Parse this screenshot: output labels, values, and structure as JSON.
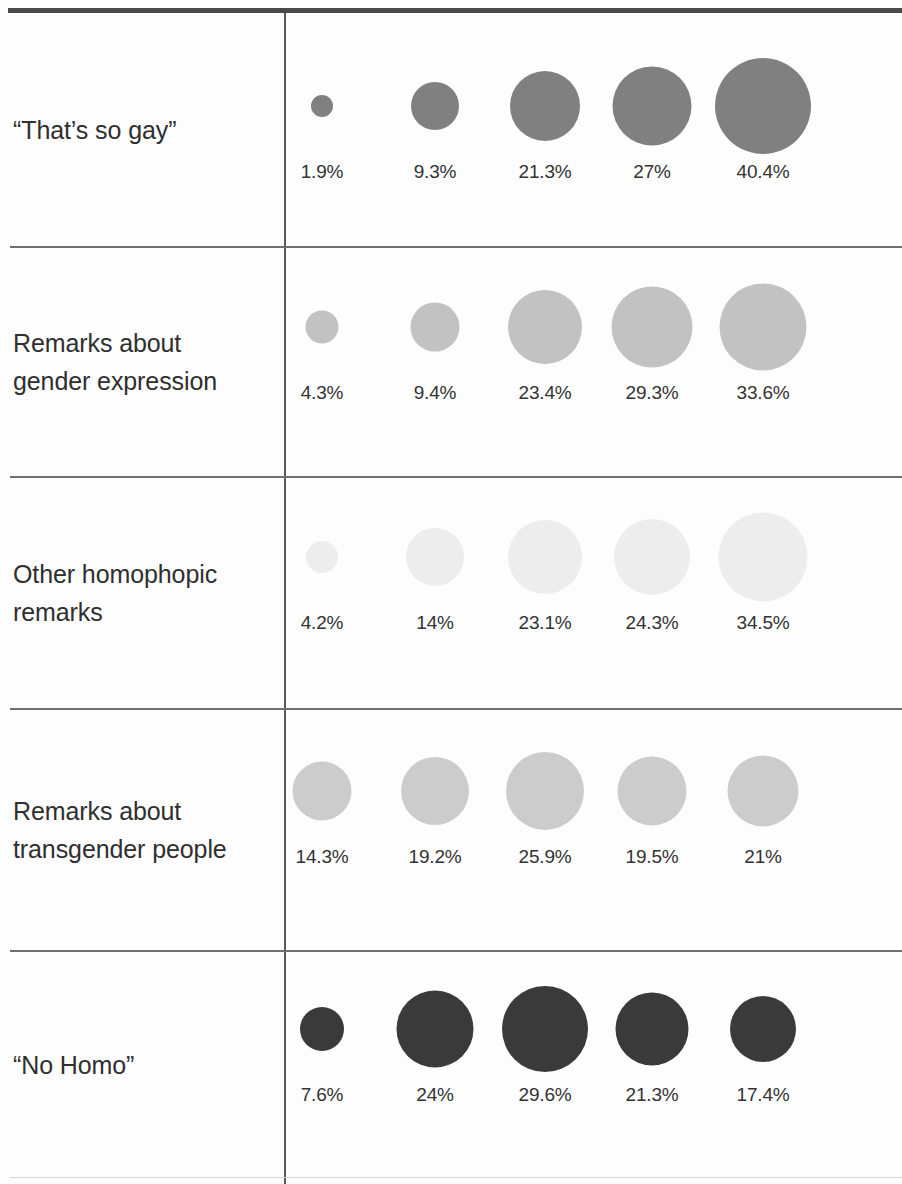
{
  "chart_data": {
    "type": "bubble",
    "title": "",
    "subtitle": "",
    "xlabel": "",
    "ylabel": "",
    "legend_position": "none",
    "grid": false,
    "value_unit": "percent",
    "encoding": "circle area proportional to percentage",
    "columns": 5,
    "categories": [
      "“That’s so gay”",
      "Remarks about\ngender expression",
      "Other homophopic\nremarks",
      "Remarks about\ntransgender people",
      "“No Homo”"
    ],
    "series": [
      {
        "name": "“That’s so gay”",
        "color": "#808080",
        "values": [
          1.9,
          9.3,
          21.3,
          27,
          40.4
        ],
        "labels": [
          "1.9%",
          "9.3%",
          "21.3%",
          "27%",
          "40.4%"
        ],
        "diameters": [
          22,
          48,
          70,
          79,
          96
        ]
      },
      {
        "name": "Remarks about gender expression",
        "color": "#c2c2c2",
        "values": [
          4.3,
          9.4,
          23.4,
          29.3,
          33.6
        ],
        "labels": [
          "4.3%",
          "9.4%",
          "23.4%",
          "29.3%",
          "33.6%"
        ],
        "diameters": [
          33,
          49,
          74,
          81,
          87
        ]
      },
      {
        "name": "Other homophopic remarks",
        "color": "#ededed",
        "values": [
          4.2,
          14,
          23.1,
          24.3,
          34.5
        ],
        "labels": [
          "4.2%",
          "14%",
          "23.1%",
          "24.3%",
          "34.5%"
        ],
        "diameters": [
          32,
          58,
          74,
          76,
          89
        ]
      },
      {
        "name": "Remarks about transgender people",
        "color": "#cccccc",
        "values": [
          14.3,
          19.2,
          25.9,
          19.5,
          21
        ],
        "labels": [
          "14.3%",
          "19.2%",
          "25.9%",
          "19.5%",
          "21%"
        ],
        "diameters": [
          59,
          68,
          78,
          69,
          71
        ]
      },
      {
        "name": "“No Homo”",
        "color": "#3a3a3a",
        "values": [
          7.6,
          24,
          29.6,
          21.3,
          17.4
        ],
        "labels": [
          "7.6%",
          "24%",
          "29.6%",
          "21.3%",
          "17.4%"
        ],
        "diameters": [
          44,
          77,
          86,
          73,
          66
        ]
      }
    ]
  },
  "rows": [
    {
      "label": "“That’s so gay”",
      "label_lines": 1,
      "color": "#808080",
      "cells": [
        {
          "label": "1.9%",
          "value": 1.9,
          "diameter": 22
        },
        {
          "label": "9.3%",
          "value": 9.3,
          "diameter": 48
        },
        {
          "label": "21.3%",
          "value": 21.3,
          "diameter": 70
        },
        {
          "label": "27%",
          "value": 27,
          "diameter": 79
        },
        {
          "label": "40.4%",
          "value": 40.4,
          "diameter": 96
        }
      ]
    },
    {
      "label": "Remarks about\ngender expression",
      "label_lines": 2,
      "color": "#c2c2c2",
      "cells": [
        {
          "label": "4.3%",
          "value": 4.3,
          "diameter": 33
        },
        {
          "label": "9.4%",
          "value": 9.4,
          "diameter": 49
        },
        {
          "label": "23.4%",
          "value": 23.4,
          "diameter": 74
        },
        {
          "label": "29.3%",
          "value": 29.3,
          "diameter": 81
        },
        {
          "label": "33.6%",
          "value": 33.6,
          "diameter": 87
        }
      ]
    },
    {
      "label": "Other homophopic\nremarks",
      "label_lines": 2,
      "color": "#ededed",
      "cells": [
        {
          "label": "4.2%",
          "value": 4.2,
          "diameter": 32
        },
        {
          "label": "14%",
          "value": 14,
          "diameter": 58
        },
        {
          "label": "23.1%",
          "value": 23.1,
          "diameter": 74
        },
        {
          "label": "24.3%",
          "value": 24.3,
          "diameter": 76
        },
        {
          "label": "34.5%",
          "value": 34.5,
          "diameter": 89
        }
      ]
    },
    {
      "label": "Remarks about\ntransgender people",
      "label_lines": 2,
      "color": "#cccccc",
      "cells": [
        {
          "label": "14.3%",
          "value": 14.3,
          "diameter": 59
        },
        {
          "label": "19.2%",
          "value": 19.2,
          "diameter": 68
        },
        {
          "label": "25.9%",
          "value": 25.9,
          "diameter": 78
        },
        {
          "label": "19.5%",
          "value": 19.5,
          "diameter": 69
        },
        {
          "label": "21%",
          "value": 21,
          "diameter": 71
        }
      ]
    },
    {
      "label": "“No Homo”",
      "label_lines": 1,
      "color": "#3a3a3a",
      "cells": [
        {
          "label": "7.6%",
          "value": 7.6,
          "diameter": 44
        },
        {
          "label": "24%",
          "value": 24,
          "diameter": 77
        },
        {
          "label": "29.6%",
          "value": 29.6,
          "diameter": 86
        },
        {
          "label": "21.3%",
          "value": 21.3,
          "diameter": 73
        },
        {
          "label": "17.4%",
          "value": 17.4,
          "diameter": 66
        }
      ]
    }
  ],
  "layout": {
    "column_centers": [
      36,
      149,
      259,
      366,
      477
    ],
    "row_tops": [
      13,
      247,
      477,
      709,
      951
    ],
    "row_bottoms": [
      247,
      477,
      709,
      951,
      1178
    ],
    "bubble_center_y": [
      93,
      80,
      80,
      82,
      78
    ],
    "value_label_y": [
      148,
      135,
      135,
      137,
      133
    ]
  }
}
